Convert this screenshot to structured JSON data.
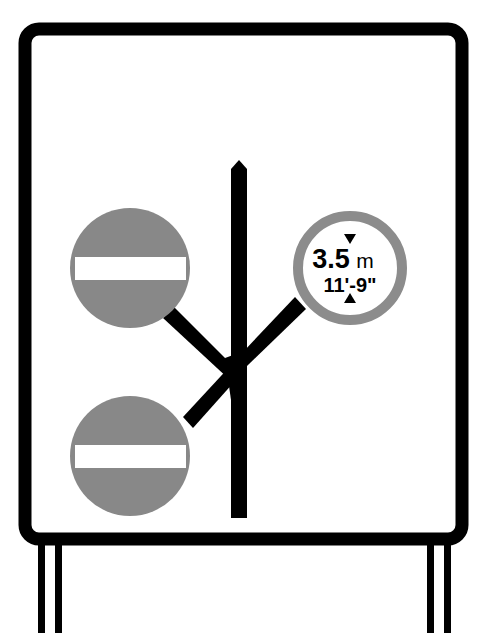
{
  "sign": {
    "type": "road-layout-restriction-sign",
    "panel_color": "#ffffff",
    "border_color": "#000000",
    "symbol_color": "#000000",
    "no_entry_color": "#888888",
    "restriction_ring_color": "#8c8c8c",
    "height_limit": {
      "metric_value": "3.5",
      "metric_unit": "m",
      "imperial": "11'-9\""
    },
    "no_entry_signs": [
      {
        "position": "upper-left",
        "label": "no entry"
      },
      {
        "position": "lower-left",
        "label": "no entry"
      }
    ]
  }
}
